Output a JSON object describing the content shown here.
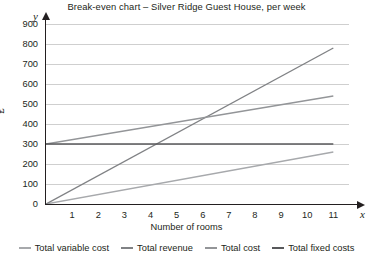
{
  "chart_data": {
    "type": "line",
    "title": "Break-even chart – Silver Ridge Guest House, per week",
    "xlabel": "Number of rooms",
    "ylabel": "£",
    "x_axis_variable": "x",
    "y_axis_variable": "y",
    "xlim": [
      0,
      11.6
    ],
    "ylim": [
      0,
      900
    ],
    "x_ticks": [
      "1",
      "2",
      "3",
      "4",
      "5",
      "6",
      "7",
      "8",
      "9",
      "10",
      "11"
    ],
    "y_ticks": [
      "0",
      "100",
      "200",
      "300",
      "400",
      "500",
      "600",
      "700",
      "800",
      "900"
    ],
    "grid": true,
    "legend_position": "bottom",
    "x": [
      0,
      11
    ],
    "series": [
      {
        "name": "Total variable cost",
        "values": [
          0,
          260
        ],
        "color": "#a7a9ac"
      },
      {
        "name": "Total revenue",
        "values": [
          0,
          780
        ],
        "color": "#808285"
      },
      {
        "name": "Total cost",
        "values": [
          300,
          540
        ],
        "color": "#939598"
      },
      {
        "name": "Total fixed costs",
        "values": [
          300,
          300
        ],
        "color": "#58595b"
      }
    ],
    "break_even": {
      "rooms": 5,
      "value": 360
    }
  }
}
